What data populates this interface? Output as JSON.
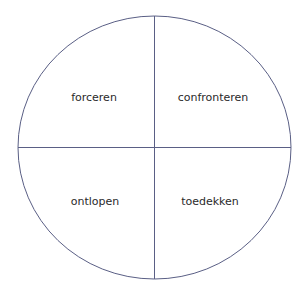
{
  "diagram": {
    "type": "quadrant-circle",
    "stroke_color": "#5a5f85",
    "quadrants": [
      {
        "position": "top-left",
        "label": "forceren"
      },
      {
        "position": "top-right",
        "label": "confronteren"
      },
      {
        "position": "bottom-left",
        "label": "ontlopen"
      },
      {
        "position": "bottom-right",
        "label": "toedekken"
      }
    ]
  }
}
